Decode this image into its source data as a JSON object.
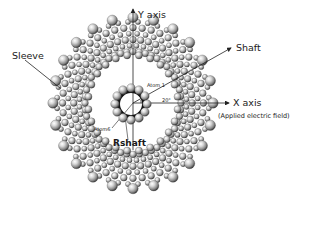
{
  "diagram": {
    "title": "",
    "labels": {
      "y_axis": "Y axis",
      "x_axis": "X axis",
      "x_axis_note": "(Applied electric field)",
      "sleeve": "Sleeve",
      "shaft": "Shaft",
      "atom1": "Atom 1",
      "atom6": "Atom6",
      "angle": "20°",
      "rshaft": "Rshaft"
    },
    "geometry": {
      "center": [
        133,
        103
      ],
      "sleeve_inner_radius": 42,
      "sleeve_outer_radius": 84,
      "shaft_radius": 15,
      "shaft_atom_count": 12,
      "sleeve_column_count": 24
    },
    "colors": {
      "atom_light": "#f2f2f2",
      "atom_mid": "#9a9a9a",
      "atom_dark": "#3a3a3a",
      "shaft_bond": "#111111",
      "line": "#222222",
      "background": "#ffffff"
    }
  }
}
